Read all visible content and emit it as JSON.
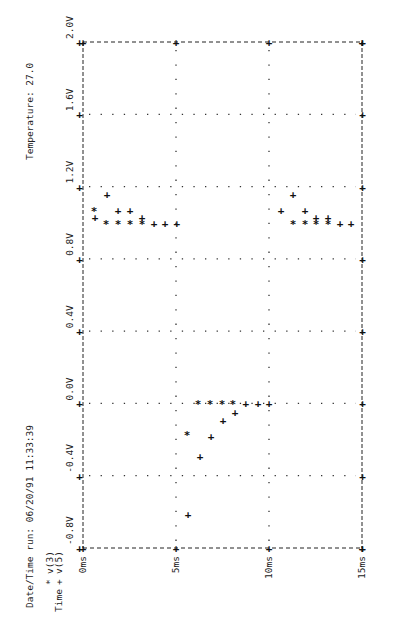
{
  "header": {
    "date_time_label": "Date/Time run: 06/20/91   11:33:39",
    "temperature_label": "Temperature:   27.0"
  },
  "legend": {
    "axis_title": "Time",
    "entries": [
      {
        "symbol": "*",
        "label": "v(3)"
      },
      {
        "symbol": "+",
        "label": "v(5)"
      }
    ]
  },
  "chart_data": {
    "type": "scatter",
    "title": "",
    "orientation": "rotated-90",
    "xlabel": "Time",
    "ylabel": "",
    "xlim": [
      0,
      15
    ],
    "ylim": [
      -0.8,
      2.0
    ],
    "x_ticks": [
      "0ms",
      "5ms",
      "10ms",
      "15ms"
    ],
    "x_tick_values": [
      0,
      5,
      10,
      15
    ],
    "y_ticks": [
      "-0.8V",
      "-0.4V",
      "0.0V",
      "0.4V",
      "0.8V",
      "1.2V",
      "1.6V",
      "2.0V"
    ],
    "y_tick_values": [
      -0.8,
      -0.4,
      0.0,
      0.4,
      0.8,
      1.2,
      1.6,
      2.0
    ],
    "grid": true,
    "legend_position": "bottom-left",
    "series": [
      {
        "name": "v(3)",
        "marker": "*",
        "points": [
          [
            0.6,
            1.07
          ],
          [
            1.24,
            1.0
          ],
          [
            1.88,
            1.0
          ],
          [
            2.53,
            1.0
          ],
          [
            3.17,
            1.0
          ],
          [
            5.59,
            -0.17
          ],
          [
            6.18,
            0.0
          ],
          [
            6.83,
            0.0
          ],
          [
            7.47,
            0.0
          ],
          [
            8.06,
            0.0
          ],
          [
            11.29,
            1.0
          ],
          [
            11.94,
            1.0
          ],
          [
            12.53,
            1.0
          ],
          [
            13.17,
            1.0
          ]
        ]
      },
      {
        "name": "v(5)",
        "marker": "+",
        "points": [
          [
            0.65,
            1.03
          ],
          [
            1.29,
            1.16
          ],
          [
            1.88,
            1.07
          ],
          [
            2.53,
            1.07
          ],
          [
            3.17,
            1.03
          ],
          [
            3.82,
            1.0
          ],
          [
            4.41,
            1.0
          ],
          [
            5.05,
            1.0
          ],
          [
            5.65,
            -0.61
          ],
          [
            6.29,
            -0.29
          ],
          [
            6.88,
            -0.18
          ],
          [
            7.53,
            -0.09
          ],
          [
            8.17,
            -0.05
          ],
          [
            8.76,
            0.0
          ],
          [
            9.41,
            0.0
          ],
          [
            10.0,
            0.0
          ],
          [
            10.65,
            1.07
          ],
          [
            11.29,
            1.16
          ],
          [
            11.94,
            1.07
          ],
          [
            12.53,
            1.03
          ],
          [
            13.17,
            1.03
          ],
          [
            13.82,
            1.0
          ],
          [
            14.41,
            1.0
          ]
        ]
      }
    ]
  }
}
